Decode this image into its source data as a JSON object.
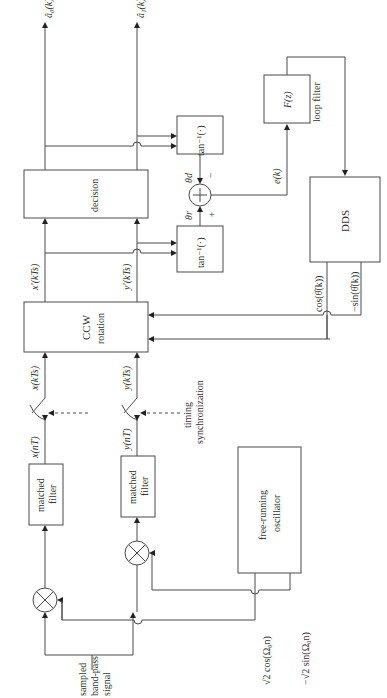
{
  "diagram": {
    "orientation": "rotated-90-ccw",
    "blocks": {
      "matched_filter_top": {
        "line1": "matched",
        "line2": "filter"
      },
      "matched_filter_bottom": {
        "line1": "matched",
        "line2": "filter"
      },
      "oscillator": {
        "line1": "free-running",
        "line2": "oscillator"
      },
      "ccw_rotation": {
        "line1": "CCW",
        "line2": "rotation"
      },
      "decision": {
        "label": "decision"
      },
      "atan_top": {
        "label": "tan⁻¹(·)"
      },
      "atan_bottom": {
        "label": "tan⁻¹(·)"
      },
      "loop_filter_block": {
        "label": "F(z)"
      },
      "dds": {
        "label": "DDS"
      }
    },
    "labels": {
      "input_signal": {
        "line1": "sampled",
        "line2": "band-pass",
        "line3": "signal"
      },
      "cos_ref": "√2 cos(Ω₀n)",
      "sin_ref": "−√2 sin(Ω₀n)",
      "x_nT": "x(nT)",
      "y_nT": "y(nT)",
      "x_kTs": "x(kTs)",
      "y_kTs": "y(kTs)",
      "x_prime": "x′(kTs)",
      "y_prime": "y′(kTs)",
      "timing": {
        "line1": "timing",
        "line2": "synchronization"
      },
      "theta_d": "θd",
      "theta_r": "θr",
      "minus_sign": "−",
      "plus_sign": "+",
      "error": "e(k)",
      "loop_filter": "loop filter",
      "cos_theta": "cos(θ̂(k))",
      "sin_theta": "−sin(θ̂(k))",
      "a0_hat": "â₀(k)",
      "a1_hat": "â₁(k)"
    }
  }
}
